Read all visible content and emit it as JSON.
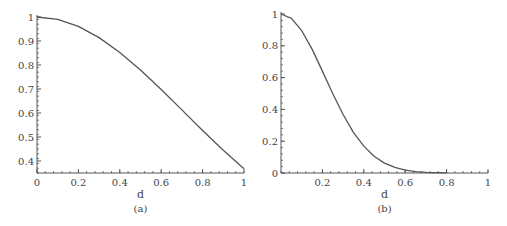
{
  "chart_data": [
    {
      "type": "line",
      "panel": "(a)",
      "caption": "(a)",
      "title": "",
      "xlabel": "d",
      "ylabel": "",
      "xlim": [
        0,
        1
      ],
      "ylim": [
        0.35,
        1
      ],
      "xticks": [
        "0",
        "0.2",
        "0.4",
        "0.6",
        "0.8",
        "1"
      ],
      "yticks": [
        "0.4",
        "0.5",
        "0.6",
        "0.7",
        "0.8",
        "0.9",
        "1"
      ],
      "grid": false,
      "legend": null,
      "series": [
        {
          "name": "curve",
          "color": "#555555",
          "x": [
            0,
            0.1,
            0.2,
            0.3,
            0.4,
            0.5,
            0.6,
            0.7,
            0.8,
            0.9,
            1.0
          ],
          "y": [
            1.0,
            0.99,
            0.961,
            0.914,
            0.852,
            0.779,
            0.698,
            0.613,
            0.527,
            0.445,
            0.368
          ]
        }
      ]
    },
    {
      "type": "line",
      "panel": "(b)",
      "caption": "(b)",
      "title": "",
      "xlabel": "d",
      "ylabel": "",
      "xlim": [
        0,
        1
      ],
      "ylim": [
        0,
        1
      ],
      "xticks": [
        "0.2",
        "0.4",
        "0.6",
        "0.8",
        "1"
      ],
      "yticks": [
        "0",
        "0.2",
        "0.4",
        "0.6",
        "0.8",
        "1"
      ],
      "grid": false,
      "legend": null,
      "series": [
        {
          "name": "curve",
          "color": "#555555",
          "x": [
            0,
            0.05,
            0.1,
            0.15,
            0.2,
            0.25,
            0.3,
            0.35,
            0.4,
            0.45,
            0.5,
            0.55,
            0.6,
            0.65,
            0.7,
            0.75,
            0.8
          ],
          "y": [
            1.0,
            0.973,
            0.895,
            0.779,
            0.641,
            0.499,
            0.368,
            0.256,
            0.169,
            0.105,
            0.062,
            0.035,
            0.018,
            0.009,
            0.004,
            0.002,
            0.001
          ]
        }
      ]
    }
  ]
}
